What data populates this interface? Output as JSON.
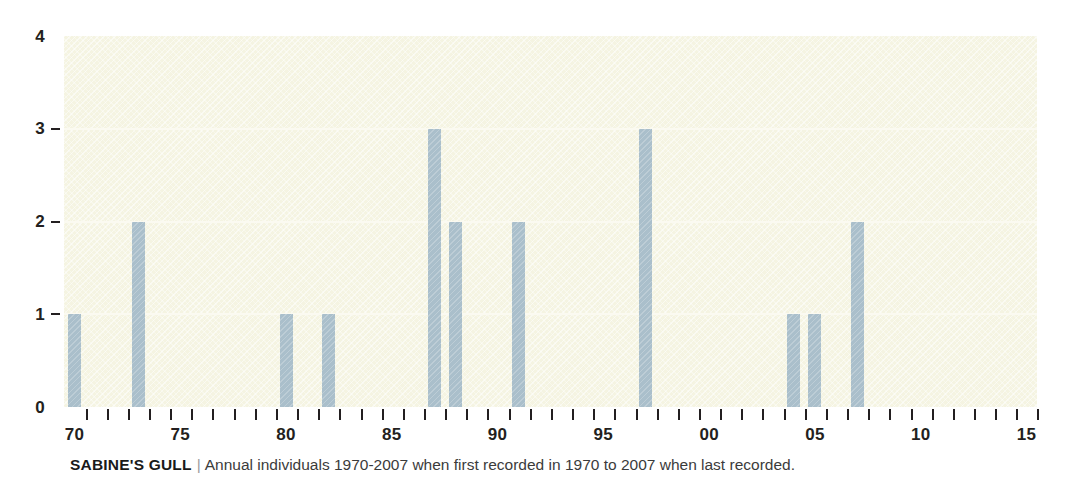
{
  "chart_data": {
    "type": "bar",
    "title": "SABINE'S GULL",
    "subtitle": "Annual individuals 1970-2007 when first recorded in 1970 to 2007 when last recorded.",
    "xlabel": "",
    "ylabel": "",
    "grid": true,
    "legend": "none",
    "xlim": [
      1969.5,
      2015.5
    ],
    "ylim": [
      0,
      4
    ],
    "x_tick_labels": [
      "70",
      "75",
      "80",
      "85",
      "90",
      "95",
      "00",
      "05",
      "10",
      "15"
    ],
    "x_tick_values": [
      1970,
      1975,
      1980,
      1985,
      1990,
      1995,
      2000,
      2005,
      2010,
      2015
    ],
    "y_tick_labels": [
      "0",
      "1",
      "2",
      "3",
      "4"
    ],
    "y_tick_values": [
      0,
      1,
      2,
      3,
      4
    ],
    "x_minor_tick_values": [
      1970,
      1971,
      1972,
      1973,
      1974,
      1975,
      1976,
      1977,
      1978,
      1979,
      1980,
      1981,
      1982,
      1983,
      1984,
      1985,
      1986,
      1987,
      1988,
      1989,
      1990,
      1991,
      1992,
      1993,
      1994,
      1995,
      1996,
      1997,
      1998,
      1999,
      2000,
      2001,
      2002,
      2003,
      2004,
      2005,
      2006,
      2007,
      2008,
      2009,
      2010,
      2011,
      2012,
      2013,
      2014,
      2015
    ],
    "categories": [
      1970,
      1971,
      1972,
      1973,
      1974,
      1975,
      1976,
      1977,
      1978,
      1979,
      1980,
      1981,
      1982,
      1983,
      1984,
      1985,
      1986,
      1987,
      1988,
      1989,
      1990,
      1991,
      1992,
      1993,
      1994,
      1995,
      1996,
      1997,
      1998,
      1999,
      2000,
      2001,
      2002,
      2003,
      2004,
      2005,
      2006,
      2007,
      2008,
      2009,
      2010,
      2011,
      2012,
      2013,
      2014,
      2015
    ],
    "values": [
      1,
      0,
      0,
      2,
      0,
      0,
      0,
      0,
      0,
      0,
      1,
      0,
      1,
      0,
      0,
      0,
      0,
      3,
      2,
      0,
      0,
      2,
      0,
      0,
      0,
      0,
      0,
      3,
      0,
      0,
      0,
      0,
      0,
      0,
      1,
      1,
      0,
      2,
      0,
      0,
      0,
      0,
      0,
      0,
      0,
      0
    ],
    "bar_color": "#aabfcb",
    "plot_background": "#f5f4e2",
    "gridline_color": "#fbfaf1",
    "axis_color": "#231f20"
  },
  "caption": {
    "species": "SABINE'S GULL",
    "separator": "|",
    "description": "Annual individuals 1970-2007 when first recorded in 1970 to 2007 when last recorded."
  }
}
